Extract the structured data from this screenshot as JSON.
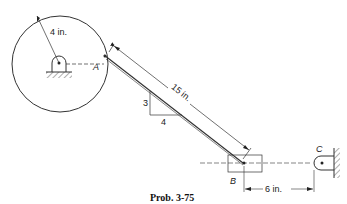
{
  "diagram": {
    "caption": "Prob. 3-75",
    "labels": {
      "radius": "4 in.",
      "link_length": "15 in.",
      "slope_rise": "3",
      "slope_run": "4",
      "point_a": "A",
      "point_b": "B",
      "point_c": "C",
      "offset": "6 in."
    }
  }
}
